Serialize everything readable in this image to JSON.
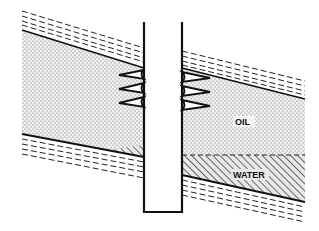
{
  "diagram": {
    "labels": {
      "oil": "OIL",
      "water": "WATER"
    },
    "components": [
      {
        "id": "well-casing",
        "description": "vertical well pipe"
      },
      {
        "id": "perforations",
        "description": "three perforation tunnels on each side of casing"
      },
      {
        "id": "oil-zone",
        "description": "stippled reservoir rock containing oil"
      },
      {
        "id": "water-zone",
        "description": "hatched zone of water below oil-water contact"
      },
      {
        "id": "cap-rock",
        "description": "dashed shale layer above reservoir"
      },
      {
        "id": "base-rock",
        "description": "dashed shale layer below reservoir"
      }
    ],
    "colors": {
      "ink": "#111111",
      "background": "#ffffff",
      "stipple": "#555555"
    }
  }
}
